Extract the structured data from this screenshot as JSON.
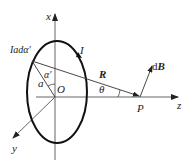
{
  "diagram": {
    "labels": {
      "x_axis": "x",
      "y_axis": "y",
      "z_axis": "z",
      "origin": "O",
      "point": "P",
      "current": "I",
      "current_element": "Iadα′",
      "radius_vector": "R",
      "field_element": "dB",
      "angle_theta": "θ",
      "radius": "a",
      "angle_alpha": "α′"
    },
    "colors": {
      "loop": "#111111",
      "axes": "#555555",
      "lines": "#333333"
    }
  }
}
